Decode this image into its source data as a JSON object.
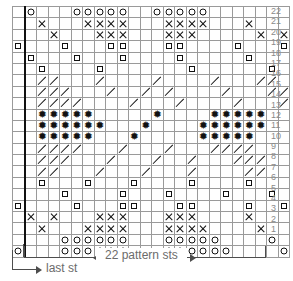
{
  "chart": {
    "columns": 24,
    "rows": 22,
    "repeat_start_column": 2,
    "symbol_legend": {
      "circle": "yarn-over / open circle stitch",
      "x": "cross / x stitch",
      "square": "small open square stitch",
      "slash": "diagonal decrease stitch",
      "star": "asterisk / bobble stitch",
      "blank": "knit stitch"
    },
    "row_numbers": [
      "22",
      "21",
      "20",
      "19",
      "18",
      "17",
      "16",
      "15",
      "14",
      "13",
      "12",
      "11",
      "10",
      "9",
      "8",
      "7",
      "6",
      "5",
      "4",
      "3",
      "2",
      "1"
    ],
    "grid": [
      {
        "row": "22",
        "cells": [
          "",
          "circle",
          "",
          "",
          "",
          "circle",
          "circle",
          "circle",
          "circle",
          "circle",
          "",
          "",
          "circle",
          "circle",
          "circle",
          "circle",
          "circle",
          "",
          "",
          "",
          "",
          "",
          "",
          ""
        ]
      },
      {
        "row": "21",
        "cells": [
          "",
          "",
          "x",
          "",
          "",
          "",
          "x",
          "x",
          "x",
          "x",
          "",
          "",
          "",
          "x",
          "x",
          "x",
          "x",
          "",
          "",
          "",
          "x",
          "",
          "",
          ""
        ]
      },
      {
        "row": "20",
        "cells": [
          "",
          "",
          "",
          "x",
          "",
          "",
          "",
          "x",
          "x",
          "x",
          "",
          "",
          "",
          "x",
          "x",
          "x",
          "",
          "",
          "",
          "",
          "",
          "x",
          "",
          "x"
        ]
      },
      {
        "row": "19",
        "cells": [
          "square",
          "",
          "",
          "",
          "square",
          "",
          "",
          "",
          "square",
          "square",
          "",
          "",
          "",
          "square",
          "square",
          "",
          "",
          "",
          "",
          "square",
          "",
          "",
          "",
          "square"
        ]
      },
      {
        "row": "18",
        "cells": [
          "",
          "square",
          "",
          "",
          "",
          "square",
          "",
          "",
          "",
          "square",
          "",
          "",
          "",
          "",
          "square",
          "",
          "",
          "",
          "",
          "",
          "square",
          "",
          "",
          ""
        ]
      },
      {
        "row": "17",
        "cells": [
          "",
          "",
          "square",
          "",
          "",
          "",
          "",
          "square",
          "",
          "",
          "",
          "",
          "",
          "",
          "",
          "square",
          "",
          "",
          "",
          "",
          "",
          "",
          "square",
          ""
        ]
      },
      {
        "row": "16",
        "cells": [
          "",
          "",
          "slash",
          "slash",
          "",
          "",
          "",
          "slash",
          "",
          "",
          "",
          "",
          "slash",
          "",
          "",
          "",
          "",
          "slash",
          "",
          "",
          "",
          "slash",
          "slash",
          ""
        ]
      },
      {
        "row": "15",
        "cells": [
          "",
          "",
          "slash",
          "slash",
          "slash",
          "",
          "",
          "",
          "slash",
          "",
          "",
          "slash",
          "",
          "slash",
          "",
          "",
          "",
          "",
          "slash",
          "",
          "",
          "",
          "slash",
          "slash"
        ]
      },
      {
        "row": "14",
        "cells": [
          "",
          "",
          "slash",
          "slash",
          "slash",
          "slash",
          "",
          "",
          "",
          "",
          "slash",
          "",
          "",
          "",
          "slash",
          "",
          "",
          "",
          "",
          "slash",
          "",
          "",
          "",
          "slash"
        ]
      },
      {
        "row": "13",
        "cells": [
          "",
          "",
          "star",
          "star",
          "star",
          "star",
          "star",
          "",
          "",
          "",
          "",
          "",
          "star",
          "",
          "",
          "",
          "",
          "star",
          "star",
          "star",
          "star",
          "star",
          "",
          ""
        ]
      },
      {
        "row": "12",
        "cells": [
          "",
          "",
          "star",
          "star",
          "star",
          "star",
          "star",
          "star",
          "",
          "",
          "",
          "star",
          "",
          "",
          "",
          "",
          "star",
          "star",
          "star",
          "star",
          "star",
          "star",
          "",
          ""
        ]
      },
      {
        "row": "11",
        "cells": [
          "",
          "",
          "star",
          "star",
          "star",
          "star",
          "star",
          "",
          "",
          "",
          "star",
          "",
          "",
          "",
          "",
          "",
          "star",
          "star",
          "star",
          "star",
          "star",
          "",
          "",
          ""
        ]
      },
      {
        "row": "10",
        "cells": [
          "",
          "",
          "slash",
          "slash",
          "slash",
          "slash",
          "",
          "",
          "",
          "slash",
          "",
          "",
          "",
          "slash",
          "",
          "",
          "",
          "slash",
          "slash",
          "slash",
          "slash",
          "",
          "",
          ""
        ]
      },
      {
        "row": "9",
        "cells": [
          "",
          "",
          "slash",
          "slash",
          "slash",
          "",
          "",
          "",
          "slash",
          "",
          "",
          "",
          "slash",
          "",
          "",
          "slash",
          "",
          "",
          "",
          "slash",
          "slash",
          "slash",
          "",
          ""
        ]
      },
      {
        "row": "8",
        "cells": [
          "",
          "",
          "slash",
          "slash",
          "",
          "",
          "",
          "slash",
          "",
          "",
          "",
          "slash",
          "",
          "",
          "",
          "slash",
          "",
          "",
          "",
          "",
          "slash",
          "slash",
          "",
          ""
        ]
      },
      {
        "row": "7",
        "cells": [
          "",
          "",
          "square",
          "",
          "",
          "",
          "square",
          "",
          "",
          "",
          "square",
          "",
          "",
          "",
          "",
          "square",
          "",
          "",
          "",
          "",
          "square",
          "",
          "",
          ""
        ]
      },
      {
        "row": "6",
        "cells": [
          "",
          "",
          "",
          "",
          "square",
          "",
          "",
          "",
          "",
          "square",
          "",
          "",
          "",
          "square",
          "",
          "",
          "",
          "",
          "square",
          "",
          "",
          "",
          "square",
          ""
        ]
      },
      {
        "row": "5",
        "cells": [
          "square",
          "",
          "",
          "",
          "",
          "square",
          "",
          "",
          "",
          "square",
          "square",
          "",
          "",
          "",
          "square",
          "square",
          "",
          "",
          "",
          "",
          "square",
          "",
          "",
          "square"
        ]
      },
      {
        "row": "4",
        "cells": [
          "",
          "x",
          "",
          "x",
          "",
          "",
          "",
          "x",
          "x",
          "x",
          "",
          "",
          "",
          "x",
          "x",
          "x",
          "",
          "",
          "",
          "",
          "x",
          "",
          "",
          ""
        ]
      },
      {
        "row": "3",
        "cells": [
          "",
          "",
          "x",
          "",
          "",
          "",
          "x",
          "x",
          "x",
          "x",
          "",
          "",
          "",
          "x",
          "x",
          "x",
          "x",
          "",
          "",
          "",
          "",
          "x",
          "",
          ""
        ]
      },
      {
        "row": "2",
        "cells": [
          "",
          "",
          "",
          "",
          "circle",
          "circle",
          "circle",
          "circle",
          "circle",
          "circle",
          "",
          "",
          "",
          "circle",
          "circle",
          "circle",
          "circle",
          "circle",
          "",
          "",
          "",
          "",
          "circle",
          ""
        ]
      },
      {
        "row": "1",
        "cells": [
          "circle",
          "",
          "",
          "",
          "circle",
          "circle",
          "circle",
          "circle",
          "circle",
          "circle",
          "",
          "",
          "",
          "circle",
          "circle",
          "circle",
          "circle",
          "circle",
          "circle",
          "",
          "",
          "",
          "",
          "circle"
        ]
      }
    ]
  },
  "annotations": {
    "repeat_label": "22 pattern sts",
    "last_stitch_label": "last st"
  },
  "colors": {
    "grid_line": "#9a9a9a",
    "border": "#111111",
    "symbol": "#111111",
    "annotation_text": "#6b6b6b",
    "rownum_text": "#8a8a8a"
  }
}
